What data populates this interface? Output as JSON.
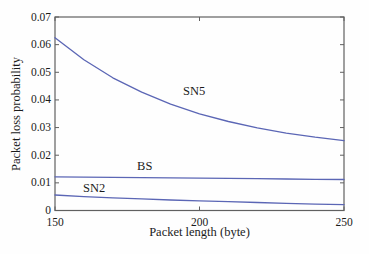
{
  "chart_data": {
    "type": "line",
    "title": "",
    "xlabel": "Packet length (byte)",
    "ylabel": "Packet loss probability",
    "xlim": [
      150,
      250
    ],
    "ylim": [
      0,
      0.07
    ],
    "x_ticks": [
      150,
      200,
      250
    ],
    "x_tick_labels": [
      "150",
      "200",
      "250"
    ],
    "y_ticks": [
      0,
      0.01,
      0.02,
      0.03,
      0.04,
      0.05,
      0.06,
      0.07
    ],
    "y_tick_labels": [
      "0",
      "0.01",
      "0.02",
      "0.03",
      "0.04",
      "0.05",
      "0.06",
      "0.07"
    ],
    "grid": "off",
    "legend": "none",
    "x": [
      150,
      160,
      170,
      180,
      190,
      200,
      210,
      220,
      230,
      240,
      250
    ],
    "series": [
      {
        "name": "SN5",
        "values": [
          0.0625,
          0.0545,
          0.048,
          0.0428,
          0.0385,
          0.035,
          0.0322,
          0.0299,
          0.028,
          0.0265,
          0.0253
        ]
      },
      {
        "name": "BS",
        "values": [
          0.0122,
          0.0121,
          0.012,
          0.0119,
          0.0118,
          0.0117,
          0.0116,
          0.0115,
          0.0114,
          0.0113,
          0.0112
        ]
      },
      {
        "name": "SN2",
        "values": [
          0.0056,
          0.005,
          0.0046,
          0.0042,
          0.0038,
          0.0035,
          0.0032,
          0.0029,
          0.0026,
          0.0023,
          0.0021
        ]
      }
    ],
    "annotations": [
      {
        "text": "SN5",
        "x": 194.3,
        "y": 0.0418
      },
      {
        "text": "BS",
        "x": 178.4,
        "y": 0.0147
      },
      {
        "text": "SN2",
        "x": 159.7,
        "y": 0.0068
      }
    ],
    "colors": {
      "line": "#5b66b5",
      "axis": "#606060",
      "text": "#1b1b1b"
    }
  }
}
